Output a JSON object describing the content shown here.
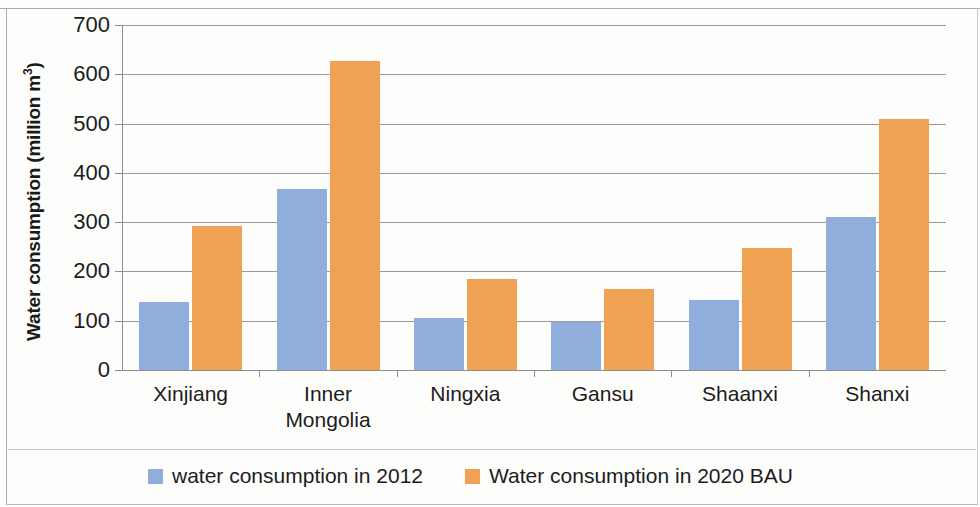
{
  "chart_data": {
    "type": "bar",
    "title": "",
    "xlabel": "",
    "ylabel": "Water consumption (million m³)",
    "ylabel_text": "Water consumption (million m",
    "ylabel_sup": "3",
    "ylabel_suffix": ")",
    "categories": [
      "Xinjiang",
      "Inner Mongolia",
      "Ningxia",
      "Gansu",
      "Shaanxi",
      "Shanxi"
    ],
    "category_lines": [
      [
        "Xinjiang"
      ],
      [
        "Inner",
        "Mongolia"
      ],
      [
        "Ningxia"
      ],
      [
        "Gansu"
      ],
      [
        "Shaanxi"
      ],
      [
        "Shanxi"
      ]
    ],
    "series": [
      {
        "name": "water consumption in 2012",
        "color": "#8FAEDC",
        "values": [
          137,
          368,
          105,
          98,
          142,
          310
        ]
      },
      {
        "name": "Water consumption in 2020 BAU",
        "color": "#F0A254",
        "values": [
          292,
          627,
          185,
          165,
          248,
          510
        ]
      }
    ],
    "ylim": [
      0,
      700
    ],
    "ytick_values": [
      0,
      100,
      200,
      300,
      400,
      500,
      600,
      700
    ],
    "ytick_labels": [
      "0",
      "100",
      "200",
      "300",
      "400",
      "500",
      "600",
      "700"
    ],
    "grid": true,
    "grid_axis": "y",
    "legend_position": "bottom"
  },
  "legend": {
    "items": [
      {
        "label": "water consumption in 2012",
        "color": "#8FAEDC"
      },
      {
        "label": "Water consumption in 2020 BAU",
        "color": "#F0A254"
      }
    ]
  }
}
